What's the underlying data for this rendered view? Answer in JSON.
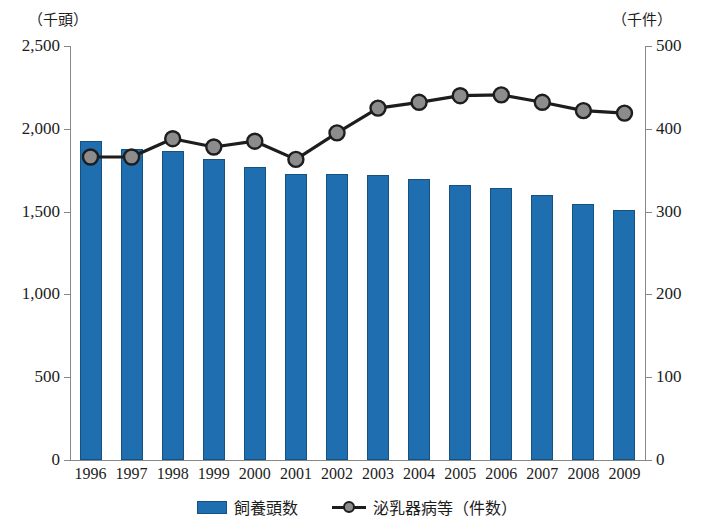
{
  "axis_units": {
    "left": "（千頭）",
    "right": "（千件）"
  },
  "legend": {
    "bar_label": "飼養頭数",
    "line_label": "泌乳器病等（件数）"
  },
  "chart_data": {
    "type": "bar",
    "title": "",
    "xlabel": "",
    "ylabel": "（千頭）",
    "y2label": "（千件）",
    "categories": [
      "1996",
      "1997",
      "1998",
      "1999",
      "2000",
      "2001",
      "2002",
      "2003",
      "2004",
      "2005",
      "2006",
      "2007",
      "2008",
      "2009"
    ],
    "ylim": [
      0,
      2500
    ],
    "y2lim": [
      0,
      500
    ],
    "yticks": [
      0,
      500,
      1000,
      1500,
      2000,
      2500
    ],
    "ytick_labels": [
      "0",
      "500",
      "1,000",
      "1,500",
      "2,000",
      "2,500"
    ],
    "y2ticks": [
      0,
      100,
      200,
      300,
      400,
      500
    ],
    "y2tick_labels": [
      "0",
      "100",
      "200",
      "300",
      "400",
      "500"
    ],
    "grid": false,
    "legend_position": "bottom",
    "series": [
      {
        "name": "飼養頭数",
        "type": "bar",
        "axis": "left",
        "unit": "千頭",
        "color": "#1f6fb0",
        "edge_color": "#15527f",
        "values": [
          1925,
          1880,
          1865,
          1815,
          1770,
          1730,
          1725,
          1720,
          1695,
          1660,
          1640,
          1600,
          1545,
          1510
        ]
      },
      {
        "name": "泌乳器病等（件数）",
        "type": "line",
        "axis": "right",
        "unit": "千件",
        "color": "#1d1d1d",
        "marker_color": "#8c8c8c",
        "values": [
          366,
          366,
          388,
          378,
          385,
          363,
          395,
          425,
          432,
          440,
          441,
          432,
          422,
          419
        ]
      }
    ]
  }
}
